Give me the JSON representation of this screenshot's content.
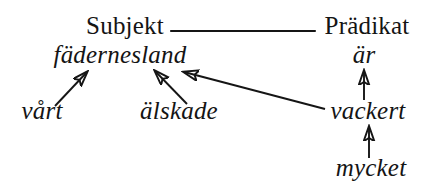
{
  "diagram": {
    "type": "dependency-tree",
    "language": "Swedish",
    "background_color": "#ffffff",
    "ink_color": "#151515",
    "sentence": "vårt älskade fädernesland är mycket vackert",
    "nodes": [
      {
        "id": "subjekt",
        "label": "Subjekt",
        "style": "upright",
        "role": "category",
        "x": 125,
        "y": 32,
        "font_size": 25
      },
      {
        "id": "pradikat",
        "label": "Prädikat",
        "style": "upright",
        "role": "category",
        "x": 367,
        "y": 32,
        "font_size": 25
      },
      {
        "id": "fadernesland",
        "label": "fädernesland",
        "style": "italic",
        "role": "head-noun",
        "x": 120,
        "y": 60,
        "font_size": 25
      },
      {
        "id": "ar",
        "label": "är",
        "style": "italic",
        "role": "copula-verb",
        "x": 364,
        "y": 60,
        "font_size": 25
      },
      {
        "id": "vart",
        "label": "vårt",
        "style": "italic",
        "role": "determiner",
        "x": 42,
        "y": 116,
        "font_size": 25
      },
      {
        "id": "alskade",
        "label": "älskade",
        "style": "italic",
        "role": "attribute",
        "x": 179,
        "y": 116,
        "font_size": 25
      },
      {
        "id": "vackert",
        "label": "vackert",
        "style": "italic",
        "role": "predicative",
        "x": 368,
        "y": 116,
        "font_size": 25
      },
      {
        "id": "mycket",
        "label": "mycket",
        "style": "italic",
        "role": "degree-adverb",
        "x": 371,
        "y": 173,
        "font_size": 25
      }
    ],
    "edges": [
      {
        "id": "subjekt-pradikat",
        "from": "subjekt",
        "to": "pradikat",
        "kind": "plain-line",
        "arrowhead": false,
        "x1": 171,
        "y1": 31,
        "x2": 315,
        "y2": 31
      },
      {
        "id": "vart-to-fadernesland",
        "from": "vart",
        "to": "fadernesland",
        "kind": "arrow",
        "arrowhead": true,
        "x1": 55,
        "y1": 106,
        "x2": 87,
        "y2": 72
      },
      {
        "id": "alskade-to-fadernesland",
        "from": "alskade",
        "to": "fadernesland",
        "kind": "arrow",
        "arrowhead": true,
        "x1": 187,
        "y1": 104,
        "x2": 155,
        "y2": 71
      },
      {
        "id": "vackert-to-fadernesland",
        "from": "vackert",
        "to": "fadernesland",
        "kind": "arrow",
        "arrowhead": true,
        "x1": 325,
        "y1": 109,
        "x2": 184,
        "y2": 72
      },
      {
        "id": "vackert-to-ar",
        "from": "vackert",
        "to": "ar",
        "kind": "arrow",
        "arrowhead": true,
        "x1": 364,
        "y1": 100,
        "x2": 364,
        "y2": 71
      },
      {
        "id": "mycket-to-vackert",
        "from": "mycket",
        "to": "vackert",
        "kind": "arrow",
        "arrowhead": true,
        "x1": 369,
        "y1": 158,
        "x2": 369,
        "y2": 127
      }
    ]
  }
}
